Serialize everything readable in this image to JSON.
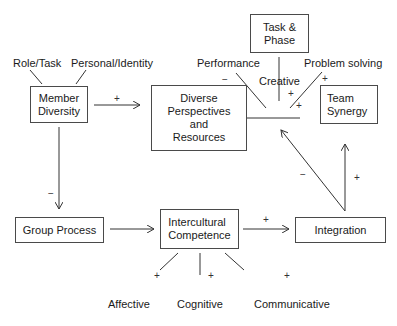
{
  "diagram": {
    "nodes": {
      "member_diversity": "Member\nDiversity",
      "diverse_perspectives": "Diverse\nPerspectives\nand\nResources",
      "task_phase": "Task &\nPhase",
      "team_synergy": "Team\nSynergy",
      "group_process": "Group Process",
      "intercultural_competence": "Intercultural\nCompetence",
      "integration": "Integration"
    },
    "labels": {
      "role_task": "Role/Task",
      "personal_identity": "Personal/Identity",
      "performance": "Performance",
      "creative": "Creative",
      "problem_solving": "Problem solving",
      "affective": "Affective",
      "cognitive": "Cognitive",
      "communicative": "Communicative"
    },
    "signs": {
      "md_to_dp": "+",
      "md_to_gp": "−",
      "performance": "−",
      "creative": "+",
      "problem_solving": "+",
      "problem_solving_2": "+",
      "ic_to_int": "+",
      "int_to_center": "−",
      "int_to_synergy": "+",
      "affective": "+",
      "cognitive": "+",
      "communicative": "+"
    },
    "edges": [
      {
        "from": "Member Diversity",
        "to": "Diverse Perspectives and Resources",
        "sign": "+"
      },
      {
        "from": "Member Diversity",
        "to": "Group Process",
        "sign": "-"
      },
      {
        "from": "Group Process",
        "to": "Intercultural Competence",
        "sign": ""
      },
      {
        "from": "Intercultural Competence",
        "to": "Integration",
        "sign": "+"
      },
      {
        "from": "Integration",
        "to": "Diverse Perspectives outcome line",
        "sign": "-"
      },
      {
        "from": "Integration",
        "to": "Team Synergy",
        "sign": "+"
      }
    ]
  }
}
